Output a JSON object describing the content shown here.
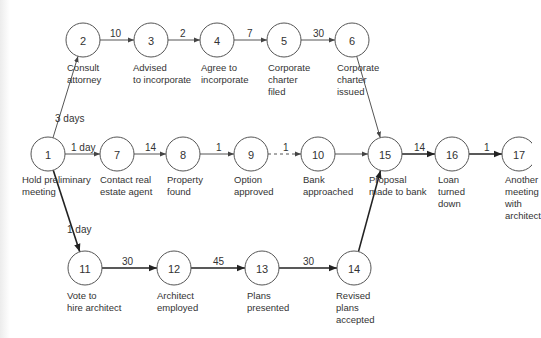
{
  "diagram": {
    "type": "activity-network",
    "nodes": [
      {
        "id": "1",
        "x": 48,
        "y": 154,
        "label": "Hold preliminary\nmeeting",
        "lx": 22,
        "ly": 174
      },
      {
        "id": "2",
        "x": 83,
        "y": 40,
        "label": "Consult\nattorney",
        "lx": 67,
        "ly": 62
      },
      {
        "id": "3",
        "x": 151,
        "y": 40,
        "label": "Advised\nto incorporate",
        "lx": 133,
        "ly": 62
      },
      {
        "id": "4",
        "x": 217,
        "y": 40,
        "label": "Agree to\nincorporate",
        "lx": 201,
        "ly": 62
      },
      {
        "id": "5",
        "x": 284,
        "y": 40,
        "label": "Corporate\ncharter\nfiled",
        "lx": 268,
        "ly": 62
      },
      {
        "id": "6",
        "x": 352,
        "y": 40,
        "label": "Corporate\ncharter\nissued",
        "lx": 337,
        "ly": 62
      },
      {
        "id": "7",
        "x": 117,
        "y": 154,
        "label": "Contact real\nestate agent",
        "lx": 100,
        "ly": 174
      },
      {
        "id": "8",
        "x": 183,
        "y": 154,
        "label": "Property\nfound",
        "lx": 167,
        "ly": 174
      },
      {
        "id": "9",
        "x": 251,
        "y": 154,
        "label": "Option\napproved",
        "lx": 234,
        "ly": 174
      },
      {
        "id": "10",
        "x": 318,
        "y": 154,
        "label": "Bank\napproached",
        "lx": 303,
        "ly": 174
      },
      {
        "id": "15",
        "x": 385,
        "y": 154,
        "label": "Proposal\nmade to bank",
        "lx": 369,
        "ly": 174
      },
      {
        "id": "16",
        "x": 452,
        "y": 154,
        "label": "Loan\nturned\ndown",
        "lx": 438,
        "ly": 174
      },
      {
        "id": "17",
        "x": 519,
        "y": 154,
        "label": "Another\nmeeting\nwith\narchitect",
        "lx": 505,
        "ly": 174
      },
      {
        "id": "11",
        "x": 85,
        "y": 268,
        "label": "Vote to\nhire architect",
        "lx": 67,
        "ly": 290
      },
      {
        "id": "12",
        "x": 174,
        "y": 268,
        "label": "Architect\nemployed",
        "lx": 157,
        "ly": 290
      },
      {
        "id": "13",
        "x": 262,
        "y": 268,
        "label": "Plans\npresented",
        "lx": 247,
        "ly": 290
      },
      {
        "id": "14",
        "x": 354,
        "y": 268,
        "label": "Revised\nplans\naccepted",
        "lx": 336,
        "ly": 290
      }
    ],
    "edges": [
      {
        "from": "1",
        "to": "2",
        "label": "3 days",
        "style": "normal",
        "lx": 55,
        "ly": 122
      },
      {
        "from": "2",
        "to": "3",
        "label": "10",
        "style": "normal",
        "lx": 110,
        "ly": 37
      },
      {
        "from": "3",
        "to": "4",
        "label": "2",
        "style": "normal",
        "lx": 180,
        "ly": 37
      },
      {
        "from": "4",
        "to": "5",
        "label": "7",
        "style": "normal",
        "lx": 247,
        "ly": 37
      },
      {
        "from": "5",
        "to": "6",
        "label": "30",
        "style": "normal",
        "lx": 313,
        "ly": 37
      },
      {
        "from": "6",
        "to": "15",
        "label": "",
        "style": "normal",
        "lx": 0,
        "ly": 0
      },
      {
        "from": "1",
        "to": "7",
        "label": "1 day",
        "style": "normal",
        "lx": 71,
        "ly": 151
      },
      {
        "from": "7",
        "to": "8",
        "label": "14",
        "style": "normal",
        "lx": 145,
        "ly": 151
      },
      {
        "from": "8",
        "to": "9",
        "label": "1",
        "style": "normal",
        "lx": 216,
        "ly": 151
      },
      {
        "from": "9",
        "to": "10",
        "label": "1",
        "style": "dashed",
        "lx": 283,
        "ly": 151
      },
      {
        "from": "10",
        "to": "15",
        "label": "",
        "style": "normal",
        "lx": 0,
        "ly": 0
      },
      {
        "from": "15",
        "to": "16",
        "label": "14",
        "style": "bold",
        "lx": 414,
        "ly": 151
      },
      {
        "from": "16",
        "to": "17",
        "label": "1",
        "style": "bold",
        "lx": 484,
        "ly": 151
      },
      {
        "from": "1",
        "to": "11",
        "label": "1 day",
        "style": "bold",
        "lx": 67,
        "ly": 233
      },
      {
        "from": "11",
        "to": "12",
        "label": "30",
        "style": "bold",
        "lx": 122,
        "ly": 265
      },
      {
        "from": "12",
        "to": "13",
        "label": "45",
        "style": "bold",
        "lx": 213,
        "ly": 265
      },
      {
        "from": "13",
        "to": "14",
        "label": "30",
        "style": "bold",
        "lx": 303,
        "ly": 265
      },
      {
        "from": "14",
        "to": "15",
        "label": "",
        "style": "bold",
        "lx": 0,
        "ly": 0
      }
    ]
  },
  "style": {
    "node_radius": 17,
    "stroke": "#555555",
    "bold_stroke": "#222222",
    "text_color": "#333333",
    "background": "#ffffff"
  }
}
